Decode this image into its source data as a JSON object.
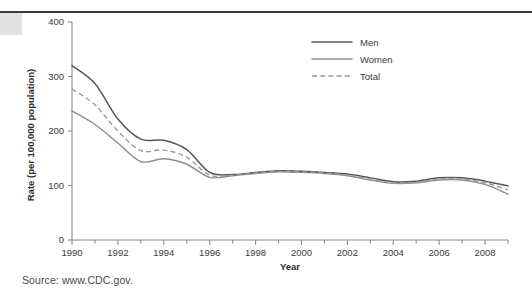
{
  "page": {
    "source_note": "Source: www.CDC.gov."
  },
  "chart_data": {
    "type": "line",
    "title": "",
    "xlabel": "Year",
    "ylabel": "Rate (per 100,000 population)",
    "xlim": [
      1990,
      2009
    ],
    "ylim": [
      0,
      400
    ],
    "yticks": [
      0,
      100,
      200,
      300,
      400
    ],
    "ytick_labels": [
      "0",
      "100",
      "200",
      "300",
      "400"
    ],
    "xticks": [
      1990,
      1992,
      1994,
      1996,
      1998,
      2000,
      2002,
      2004,
      2006,
      2008
    ],
    "xtick_labels": [
      "1990",
      "1992",
      "1994",
      "1996",
      "1998",
      "2000",
      "2002",
      "2004",
      "2006",
      "2008"
    ],
    "x_minor_ticks": [
      1991,
      1993,
      1995,
      1997,
      1999,
      2001,
      2003,
      2005,
      2007,
      2009
    ],
    "grid": false,
    "legend_position": "top-right",
    "x": [
      1990,
      1991,
      1992,
      1993,
      1994,
      1995,
      1996,
      1997,
      1998,
      1999,
      2000,
      2001,
      2002,
      2003,
      2004,
      2005,
      2006,
      2007,
      2008,
      2009
    ],
    "series": [
      {
        "name": "Men",
        "style": "solid",
        "color": "#56565a",
        "values": [
          320,
          287,
          222,
          185,
          183,
          166,
          124,
          120,
          124,
          127,
          126,
          124,
          121,
          114,
          107,
          108,
          114,
          114,
          108,
          99
        ]
      },
      {
        "name": "Women",
        "style": "solid",
        "color": "#8d8d92",
        "values": [
          237,
          212,
          178,
          144,
          149,
          139,
          115,
          118,
          122,
          125,
          124,
          122,
          118,
          110,
          104,
          105,
          110,
          110,
          102,
          84
        ]
      },
      {
        "name": "Total",
        "style": "dashed",
        "color": "#9a9a9e",
        "values": [
          277,
          248,
          200,
          164,
          165,
          152,
          119,
          119,
          123,
          126,
          125,
          123,
          119,
          112,
          105,
          106,
          112,
          112,
          105,
          92
        ]
      }
    ]
  },
  "legend": {
    "items": [
      {
        "label": "Men"
      },
      {
        "label": "Women"
      },
      {
        "label": "Total"
      }
    ]
  }
}
